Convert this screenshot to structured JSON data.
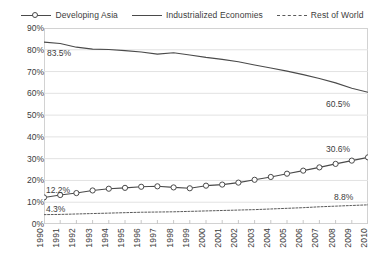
{
  "chart_data": {
    "type": "line",
    "title": "",
    "subtitle": "",
    "xlabel": "",
    "ylabel": "",
    "grid": "horizontal",
    "legend_position": "top",
    "ylim": [
      0,
      90
    ],
    "ytick_values": [
      90,
      80,
      70,
      60,
      50,
      40,
      30,
      20,
      10,
      0
    ],
    "ytick_labels": [
      "90%",
      "80%",
      "70%",
      "60%",
      "50%",
      "40%",
      "30%",
      "20%",
      "10%",
      "0%"
    ],
    "x": [
      1990,
      1991,
      1992,
      1993,
      1994,
      1995,
      1996,
      1997,
      1998,
      1999,
      2000,
      2001,
      2002,
      2003,
      2004,
      2005,
      2006,
      2007,
      2008,
      2009,
      2010
    ],
    "xtick_labels": [
      "1990",
      "1991",
      "1992",
      "1993",
      "1994",
      "1995",
      "1996",
      "1997",
      "1998",
      "1999",
      "2000",
      "2001",
      "2002",
      "2003",
      "2004",
      "2005",
      "2006",
      "2007",
      "2008",
      "2009",
      "2010"
    ],
    "series": [
      {
        "name": "Developing Asia",
        "style": "line-with-circle-markers",
        "color": "#4a4a4a",
        "values": [
          12.2,
          13.3,
          14.2,
          15.4,
          16.2,
          16.6,
          17.1,
          17.3,
          16.8,
          16.4,
          17.6,
          18.1,
          19.0,
          20.3,
          21.6,
          23.1,
          24.5,
          26.0,
          27.6,
          29.1,
          30.6
        ]
      },
      {
        "name": "Industrialized Economies",
        "style": "solid-line",
        "color": "#4a4a4a",
        "values": [
          83.5,
          82.9,
          81.2,
          80.3,
          80.1,
          79.6,
          79.0,
          78.0,
          78.6,
          77.6,
          76.5,
          75.6,
          74.5,
          73.0,
          71.6,
          70.2,
          68.6,
          66.8,
          64.8,
          62.3,
          60.5
        ]
      },
      {
        "name": "Rest of World",
        "style": "dotted-line",
        "color": "#5a5a5a",
        "values": [
          4.3,
          4.4,
          4.6,
          4.8,
          5.0,
          5.2,
          5.4,
          5.5,
          5.6,
          5.8,
          6.0,
          6.2,
          6.4,
          6.6,
          6.9,
          7.2,
          7.5,
          7.9,
          8.2,
          8.5,
          8.8
        ]
      }
    ],
    "annotations": [
      {
        "text": "83.5%",
        "series": "Industrialized Economies",
        "x": 1990,
        "y": 83.5
      },
      {
        "text": "60.5%",
        "series": "Industrialized Economies",
        "x": 2010,
        "y": 60.5
      },
      {
        "text": "12.2%",
        "series": "Developing Asia",
        "x": 1990,
        "y": 12.2
      },
      {
        "text": "30.6%",
        "series": "Developing Asia",
        "x": 2010,
        "y": 30.6
      },
      {
        "text": "4.3%",
        "series": "Rest of World",
        "x": 1990,
        "y": 4.3
      },
      {
        "text": "8.8%",
        "series": "Rest of World",
        "x": 2010,
        "y": 8.8
      }
    ]
  },
  "legend": {
    "items": [
      {
        "label": "Developing Asia",
        "marker": "line-circle-marker-icon"
      },
      {
        "label": "Industrialized Economies",
        "marker": "solid-line-icon"
      },
      {
        "label": "Rest of World",
        "marker": "dashed-line-icon"
      }
    ]
  }
}
